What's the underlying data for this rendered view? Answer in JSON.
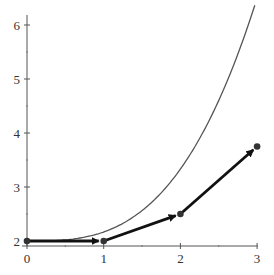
{
  "chart_data": {
    "type": "line",
    "title": "",
    "xlabel": "",
    "ylabel": "",
    "xlim": [
      0,
      3
    ],
    "ylim": [
      2,
      6.2
    ],
    "grid": false,
    "x_ticks": [
      "0",
      "1",
      "2",
      "3"
    ],
    "y_ticks": [
      "2",
      "3",
      "4",
      "5",
      "6"
    ],
    "series": [
      {
        "name": "exact solution curve",
        "style": "thin smooth curve",
        "x": [
          0,
          0.5,
          1,
          1.5,
          2,
          2.5,
          2.97
        ],
        "y": [
          2.0,
          2.02,
          2.17,
          2.56,
          3.33,
          4.6,
          6.2
        ]
      },
      {
        "name": "Euler approximation",
        "style": "thick arrows with dots",
        "x": [
          0,
          1,
          2,
          3
        ],
        "y": [
          2.0,
          2.0,
          2.5,
          3.75
        ]
      }
    ]
  }
}
